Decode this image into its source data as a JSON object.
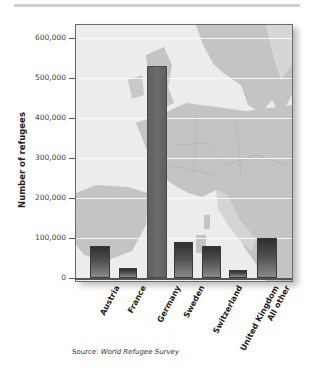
{
  "chart_data": {
    "type": "bar",
    "title": "",
    "xlabel": "",
    "ylabel": "Number of refugees",
    "ylim": [
      0,
      600000
    ],
    "yticks": [
      0,
      100000,
      200000,
      300000,
      400000,
      500000,
      600000
    ],
    "ytick_labels": [
      "0",
      "100,000",
      "200,000",
      "300,000",
      "400,000",
      "500,000",
      "600,000"
    ],
    "categories": [
      "Austria",
      "France",
      "Germany",
      "Sweden",
      "Switzerland",
      "United Kingdom",
      "All other"
    ],
    "values": [
      80000,
      25000,
      530000,
      90000,
      80000,
      20000,
      100000
    ],
    "background": "map of Europe",
    "grid": true,
    "source_prefix": "Source: ",
    "source_name": "World Refugee Survey"
  },
  "colors": {
    "bar_dark": "#2f2f2f",
    "bar_light": "#8a8a8a",
    "germany_bar": "#666666",
    "map_sea": "#ececec",
    "map_land": "#c4c4c4"
  }
}
